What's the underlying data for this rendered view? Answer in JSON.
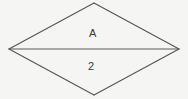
{
  "figure": {
    "type": "line-diagram",
    "shape_name": "rhombus",
    "background_color": "#f5f5f3",
    "stroke_color": "#555555",
    "canvas": {
      "width": 188,
      "height": 99
    },
    "vertices": {
      "left": {
        "x": 9,
        "y": 49
      },
      "top": {
        "x": 94,
        "y": 3
      },
      "right": {
        "x": 179,
        "y": 49
      },
      "bottom": {
        "x": 94,
        "y": 95
      }
    },
    "edges": [
      {
        "name": "top-left-edge",
        "from": "left",
        "to": "top"
      },
      {
        "name": "top-right-edge",
        "from": "top",
        "to": "right"
      },
      {
        "name": "bottom-right-edge",
        "from": "right",
        "to": "bottom"
      },
      {
        "name": "bottom-left-edge",
        "from": "bottom",
        "to": "left"
      }
    ],
    "diagonal": {
      "name": "horizontal-diagonal",
      "from": "left",
      "to": "right"
    },
    "labels": {
      "upper_region": "A",
      "lower_region": "2"
    },
    "label_positions": {
      "upper_region": {
        "x": 92,
        "y": 34
      },
      "lower_region": {
        "x": 91,
        "y": 67
      }
    }
  }
}
